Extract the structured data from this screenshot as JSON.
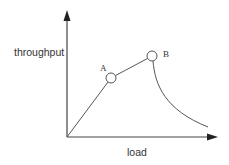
{
  "diagram": {
    "title": "",
    "x_axis_label": "load",
    "y_axis_label": "throughput",
    "points": [
      {
        "id": "A",
        "label": "A"
      },
      {
        "id": "B",
        "label": "B"
      }
    ],
    "colors": {
      "line": "#444444",
      "text": "#333333",
      "background": "#ffffff"
    }
  }
}
